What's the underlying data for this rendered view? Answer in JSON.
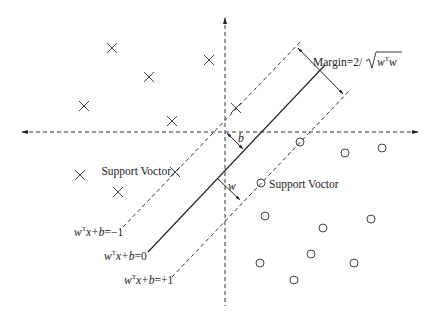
{
  "diagram": {
    "type": "svm-maximum-margin",
    "colors": {
      "background": "#ffffff",
      "ink": "#222222",
      "marker": "#444444"
    },
    "axes": {
      "horizontal": {
        "y": 132,
        "x1": 22,
        "x2": 418,
        "style": "dashed",
        "arrows": "both"
      },
      "vertical": {
        "x": 225,
        "y1": 18,
        "y2": 306,
        "style": "dashed",
        "arrows": "top"
      }
    },
    "lines": {
      "hyperplane": {
        "label": "wᵀx+b=0",
        "x1": 148,
        "y1": 252,
        "x2": 325,
        "y2": 65,
        "style": "solid"
      },
      "negative_margin": {
        "label": "wᵀx+b=−1",
        "x1": 123,
        "y1": 227,
        "x2": 302,
        "y2": 40,
        "style": "dashed"
      },
      "positive_margin": {
        "label": "wᵀx+b=+1",
        "x1": 172,
        "y1": 277,
        "x2": 350,
        "y2": 90,
        "style": "dashed"
      }
    },
    "arrows": {
      "margin": {
        "x1": 298,
        "y1": 48,
        "x2": 343,
        "y2": 94,
        "double": true
      },
      "b": {
        "x1": 227,
        "y1": 133,
        "x2": 243,
        "y2": 149,
        "double": true
      },
      "w": {
        "x1": 217,
        "y1": 178,
        "x2": 240,
        "y2": 200,
        "double": false
      }
    },
    "labels": {
      "margin": {
        "prefix": "Margin=2/",
        "radicand_base": "w",
        "radicand_sup": "T",
        "radicand_tail": "w"
      },
      "b": "b",
      "w": "w",
      "support_vector_left": "Support Voctor",
      "support_vector_right": "Support Voctor",
      "eq_neg": {
        "w": "w",
        "sup": "T",
        "rest": "x+",
        "b": "b",
        "tail": "=−1"
      },
      "eq_zero": {
        "w": "w",
        "sup": "T",
        "rest": "x+",
        "b": "b",
        "tail": "=0"
      },
      "eq_pos": {
        "w": "w",
        "sup": "T",
        "rest": "x+",
        "b": "b",
        "tail": "=+1"
      }
    },
    "class_negative_points_x": [
      [
        112,
        48
      ],
      [
        149,
        77
      ],
      [
        84,
        106
      ],
      [
        172,
        121
      ],
      [
        209,
        60
      ],
      [
        236,
        108
      ],
      [
        80,
        175
      ],
      [
        118,
        192
      ],
      [
        175,
        172
      ]
    ],
    "class_positive_points_o": [
      [
        300,
        142
      ],
      [
        345,
        153
      ],
      [
        382,
        148
      ],
      [
        261,
        183
      ],
      [
        265,
        216
      ],
      [
        323,
        228
      ],
      [
        371,
        219
      ],
      [
        260,
        263
      ],
      [
        311,
        254
      ],
      [
        354,
        263
      ],
      [
        294,
        280
      ]
    ]
  }
}
